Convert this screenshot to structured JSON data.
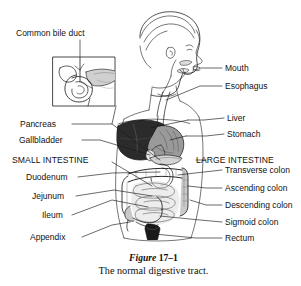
{
  "figure": {
    "title_prefix": "Figure",
    "title_number": "17–1",
    "caption": "The normal digestive tract.",
    "colors": {
      "background": "#ffffff",
      "ink": "#121212",
      "liver_fill": "#2b2b2b",
      "stomach_fill": "#9a9a9a",
      "intestine_fill": "#c9c9c9",
      "rectum_fill": "#1a1a1a",
      "leader_line": "#1a1a1a"
    }
  },
  "labels": {
    "left": [
      {
        "id": "common-bile-duct",
        "text": "Common bile duct"
      },
      {
        "id": "pancreas",
        "text": "Pancreas"
      },
      {
        "id": "gallbladder",
        "text": "Gallbladder"
      },
      {
        "id": "small-intestine",
        "text": "SMALL INTESTINE",
        "emphasis": "caps"
      },
      {
        "id": "duodenum",
        "text": "Duodenum"
      },
      {
        "id": "jejunum",
        "text": "Jejunum"
      },
      {
        "id": "ileum",
        "text": "Ileum"
      },
      {
        "id": "appendix",
        "text": "Appendix"
      }
    ],
    "right": [
      {
        "id": "mouth",
        "text": "Mouth"
      },
      {
        "id": "esophagus",
        "text": "Esophagus"
      },
      {
        "id": "liver",
        "text": "Liver"
      },
      {
        "id": "stomach",
        "text": "Stomach"
      },
      {
        "id": "large-intestine",
        "text": "LARGE INTESTINE",
        "emphasis": "caps"
      },
      {
        "id": "transverse-colon",
        "text": "Transverse colon"
      },
      {
        "id": "ascending-colon",
        "text": "Ascending colon"
      },
      {
        "id": "descending-colon",
        "text": "Descending colon"
      },
      {
        "id": "sigmoid-colon",
        "text": "Sigmoid colon"
      },
      {
        "id": "rectum",
        "text": "Rectum"
      }
    ]
  },
  "inset": {
    "id": "biliary-detail-inset",
    "description": "magnified view of gallbladder, common bile duct and pancreatic head"
  }
}
